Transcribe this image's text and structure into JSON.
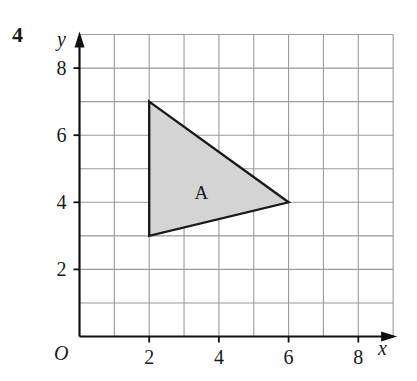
{
  "question_number": "4",
  "axes": {
    "x_label": "x",
    "y_label": "y",
    "origin_label": "O",
    "x_ticks": [
      {
        "value": 2,
        "label": "2"
      },
      {
        "value": 4,
        "label": "4"
      },
      {
        "value": 6,
        "label": "6"
      },
      {
        "value": 8,
        "label": "8"
      }
    ],
    "y_ticks": [
      {
        "value": 2,
        "label": "2"
      },
      {
        "value": 4,
        "label": "4"
      },
      {
        "value": 6,
        "label": "6"
      },
      {
        "value": 8,
        "label": "8"
      }
    ],
    "x_range": [
      0,
      9
    ],
    "y_range": [
      0,
      9
    ]
  },
  "shapes": [
    {
      "label": "A",
      "type": "triangle",
      "vertices": [
        [
          2,
          7
        ],
        [
          6,
          4
        ],
        [
          2,
          3
        ]
      ],
      "fill": "#d4d4d4",
      "stroke": "#1a1a1a"
    }
  ],
  "colors": {
    "grid": "#9a9a9a",
    "axis": "#111111",
    "text": "#1a1a1a"
  }
}
